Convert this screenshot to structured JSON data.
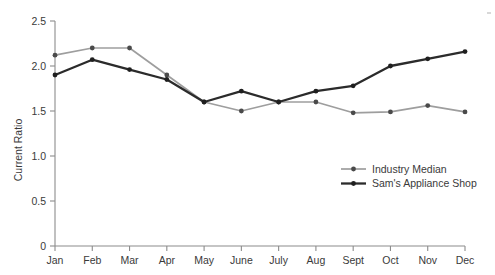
{
  "chart_data": {
    "type": "line",
    "title": "",
    "xlabel": "",
    "ylabel": "Current Ratio",
    "categories": [
      "Jan",
      "Feb",
      "Mar",
      "Apr",
      "May",
      "June",
      "July",
      "Aug",
      "Sept",
      "Oct",
      "Nov",
      "Dec"
    ],
    "ylim": [
      0,
      2.5
    ],
    "yticks": [
      0,
      0.5,
      1.0,
      1.5,
      2.0,
      2.5
    ],
    "ytick_labels": [
      "0",
      "0.5",
      "1.0",
      "1.5",
      "2.0",
      "2.5"
    ],
    "grid": false,
    "legend_position": "lower-right",
    "series": [
      {
        "name": "Industry Median",
        "color": "#9e9e9e",
        "marker": "circle",
        "values": [
          2.12,
          2.2,
          2.2,
          1.9,
          1.6,
          1.5,
          1.6,
          1.6,
          1.48,
          1.49,
          1.56,
          1.49
        ]
      },
      {
        "name": "Sam's Appliance Shop",
        "color": "#2b2b2b",
        "marker": "circle",
        "values": [
          1.9,
          2.07,
          1.96,
          1.85,
          1.6,
          1.72,
          1.6,
          1.72,
          1.78,
          2.0,
          2.08,
          2.16
        ]
      }
    ]
  },
  "legend": {
    "items": [
      {
        "label": "Industry Median"
      },
      {
        "label": "Sam's Appliance Shop"
      }
    ]
  },
  "axes": {
    "y_axis_title": "Current Ratio"
  },
  "colors": {
    "industry_median": "#9e9e9e",
    "sams_appliance_shop": "#2b2b2b",
    "axis": "#8c8c8c",
    "text": "#3a3a3a",
    "background": "#ffffff"
  }
}
